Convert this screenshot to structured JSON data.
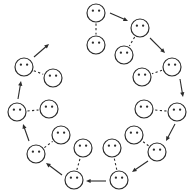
{
  "figure": {
    "title": "Ring of paired agent nodes",
    "description": "Ten pairs of circular face-like agent nodes arranged around a ring; each pair is joined by a dashed link and consecutive pairs are joined by solid directed arrows flowing clockwise.",
    "canvas": {
      "width": 196,
      "height": 196,
      "background": "#ffffff"
    },
    "style": {
      "stroke_color": "#2b2b2b",
      "fill_color": "#ffffff",
      "eye_color": "#2b2b2b",
      "node_radius": 9,
      "eye_radius": 1.15,
      "dashed_pattern": "2.2 2.4"
    }
  },
  "chart_data": {
    "type": "diagram",
    "title": "Ring of paired agent nodes",
    "layout": "circular-ring",
    "pair_count": 10,
    "node_count": 20,
    "arrow_count": 10,
    "flow_direction": "clockwise",
    "legend": [
      {
        "key": "node",
        "label": "agent node (circle with two dots)"
      },
      {
        "key": "pair-link",
        "label": "dashed intra-pair link"
      },
      {
        "key": "flow-arrow",
        "label": "solid inter-pair directed arrow"
      }
    ],
    "pairs": [
      {
        "id": "pair-1",
        "index": 0,
        "angle_deg": 270,
        "outer": {
          "cx": 96,
          "cy": 13
        },
        "inner": {
          "cx": 96,
          "cy": 45
        }
      },
      {
        "id": "pair-2",
        "index": 1,
        "angle_deg": 306,
        "outer": {
          "cx": 140,
          "cy": 28
        },
        "inner": {
          "cx": 124,
          "cy": 55
        }
      },
      {
        "id": "pair-3",
        "index": 2,
        "angle_deg": 342,
        "outer": {
          "cx": 172,
          "cy": 67
        },
        "inner": {
          "cx": 142,
          "cy": 77
        }
      },
      {
        "id": "pair-4",
        "index": 3,
        "angle_deg": 18,
        "outer": {
          "cx": 177,
          "cy": 112
        },
        "inner": {
          "cx": 144,
          "cy": 109
        }
      },
      {
        "id": "pair-5",
        "index": 4,
        "angle_deg": 54,
        "outer": {
          "cx": 157,
          "cy": 152
        },
        "inner": {
          "cx": 134,
          "cy": 135
        }
      },
      {
        "id": "pair-6",
        "index": 5,
        "angle_deg": 90,
        "outer": {
          "cx": 119,
          "cy": 180
        },
        "inner": {
          "cx": 112,
          "cy": 148
        }
      },
      {
        "id": "pair-7",
        "index": 6,
        "angle_deg": 126,
        "outer": {
          "cx": 74,
          "cy": 180
        },
        "inner": {
          "cx": 83,
          "cy": 148
        }
      },
      {
        "id": "pair-8",
        "index": 7,
        "angle_deg": 162,
        "outer": {
          "cx": 36,
          "cy": 154
        },
        "inner": {
          "cx": 61,
          "cy": 135
        }
      },
      {
        "id": "pair-9",
        "index": 8,
        "angle_deg": 198,
        "outer": {
          "cx": 17,
          "cy": 112
        },
        "inner": {
          "cx": 49,
          "cy": 109
        }
      },
      {
        "id": "pair-10",
        "index": 9,
        "angle_deg": 234,
        "outer": {
          "cx": 24,
          "cy": 67
        },
        "inner": {
          "cx": 53,
          "cy": 78
        }
      }
    ],
    "arrows": [
      {
        "id": "arrow-1",
        "from_pair": "pair-1",
        "to_pair": "pair-2",
        "x1": 110,
        "y1": 13,
        "x2": 128,
        "y2": 21
      },
      {
        "id": "arrow-2",
        "from_pair": "pair-2",
        "to_pair": "pair-3",
        "x1": 150,
        "y1": 38,
        "x2": 165,
        "y2": 53
      },
      {
        "id": "arrow-3",
        "from_pair": "pair-3",
        "to_pair": "pair-4",
        "x1": 180,
        "y1": 79,
        "x2": 183,
        "y2": 97
      },
      {
        "id": "arrow-4",
        "from_pair": "pair-4",
        "to_pair": "pair-5",
        "x1": 175,
        "y1": 124,
        "x2": 166,
        "y2": 141
      },
      {
        "id": "arrow-5",
        "from_pair": "pair-5",
        "to_pair": "pair-6",
        "x1": 148,
        "y1": 161,
        "x2": 132,
        "y2": 172
      },
      {
        "id": "arrow-6",
        "from_pair": "pair-6",
        "to_pair": "pair-7",
        "x1": 106,
        "y1": 181,
        "x2": 86,
        "y2": 181
      },
      {
        "id": "arrow-7",
        "from_pair": "pair-7",
        "to_pair": "pair-8",
        "x1": 62,
        "y1": 175,
        "x2": 46,
        "y2": 163
      },
      {
        "id": "arrow-8",
        "from_pair": "pair-8",
        "to_pair": "pair-9",
        "x1": 29,
        "y1": 141,
        "x2": 23,
        "y2": 124
      },
      {
        "id": "arrow-9",
        "from_pair": "pair-9",
        "to_pair": "pair-10",
        "x1": 18,
        "y1": 99,
        "x2": 21,
        "y2": 81
      },
      {
        "id": "arrow-10",
        "from_pair": "pair-10",
        "to_pair": "pair-1",
        "x1": 34,
        "y1": 57,
        "x2": 49,
        "y2": 44
      }
    ]
  }
}
